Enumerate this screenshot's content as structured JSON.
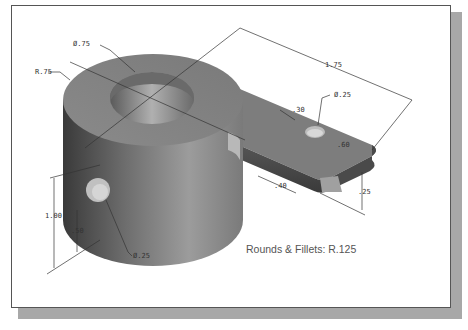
{
  "figure": {
    "type": "isometric-shaded-part-drawing",
    "dimensions": [
      {
        "id": "bore-diameter",
        "label": "Ø.75"
      },
      {
        "id": "boss-radius",
        "label": "R.75"
      },
      {
        "id": "overall-length",
        "label": "1.75"
      },
      {
        "id": "small-hole-diameter",
        "label": "Ø.25"
      },
      {
        "id": "arm-hole-offset",
        "label": ".30"
      },
      {
        "id": "arm-width",
        "label": ".60"
      },
      {
        "id": "arm-hole-distance",
        "label": ".40"
      },
      {
        "id": "arm-thickness",
        "label": ".25"
      },
      {
        "id": "overall-height",
        "label": "1.00"
      },
      {
        "id": "side-hole-height",
        "label": ".50"
      },
      {
        "id": "side-hole-diameter",
        "label": "Ø.25"
      }
    ],
    "note": "Rounds & Fillets: R.125",
    "colors": {
      "part_light": "#9a9a9a",
      "part_dark": "#3c3c3c",
      "frame_shadow": "#a8a8a8",
      "dimension_line": "#333333"
    }
  }
}
